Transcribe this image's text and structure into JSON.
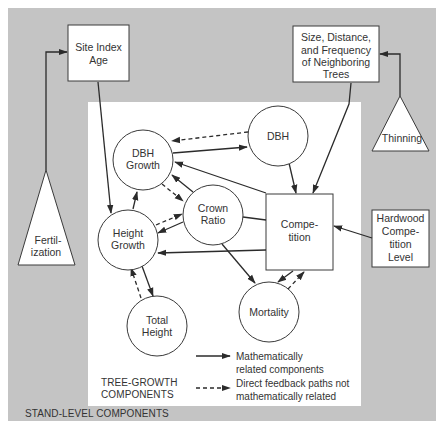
{
  "diagram": {
    "colors": {
      "stand_background": "#c4c4c4",
      "tree_panel": "#ffffff",
      "stroke": "#2b2b2b"
    },
    "regions": {
      "stand_level_label": "STAND-LEVEL COMPONENTS",
      "tree_growth_label_line1": "TREE-GROWTH",
      "tree_growth_label_line2": "COMPONENTS"
    },
    "boxes": {
      "site_index": {
        "line1": "Site Index",
        "line2": "Age"
      },
      "neighbors": {
        "line1": "Size, Distance,",
        "line2": "and Frequency",
        "line3": "of Neighboring",
        "line4": "Trees"
      },
      "hardwood": {
        "line1": "Hardwood",
        "line2": "Compe-",
        "line3": "tition",
        "line4": "Level"
      },
      "competition": {
        "line1": "Compe-",
        "line2": "tition"
      }
    },
    "triangles": {
      "fertilization": {
        "line1": "Fertil-",
        "line2": "ization"
      },
      "thinning": {
        "line1": "Thinning"
      }
    },
    "circles": {
      "dbh_growth": {
        "line1": "DBH",
        "line2": "Growth"
      },
      "dbh": {
        "line1": "DBH"
      },
      "crown_ratio": {
        "line1": "Crown",
        "line2": "Ratio"
      },
      "height_growth": {
        "line1": "Height",
        "line2": "Growth"
      },
      "total_height": {
        "line1": "Total",
        "line2": "Height"
      },
      "mortality": {
        "line1": "Mortality"
      }
    },
    "legend": {
      "solid_line1": "Mathematically",
      "solid_line2": "related components",
      "dashed_line1": "Direct feedback paths not",
      "dashed_line2": "mathematically related"
    },
    "edges": [
      {
        "from": "Fertilization",
        "to": "Site Index Age",
        "type": "solid"
      },
      {
        "from": "Thinning",
        "to": "Size, Distance, and Frequency of Neighboring Trees",
        "type": "solid"
      },
      {
        "from": "Site Index Age",
        "to": "Height Growth",
        "type": "solid"
      },
      {
        "from": "Size, Distance, and Frequency of Neighboring Trees",
        "to": "Competition",
        "type": "solid"
      },
      {
        "from": "Hardwood Competition Level",
        "to": "Competition",
        "type": "solid"
      },
      {
        "from": "DBH Growth",
        "to": "DBH",
        "type": "solid"
      },
      {
        "from": "DBH",
        "to": "DBH Growth",
        "type": "dashed"
      },
      {
        "from": "DBH",
        "to": "Competition",
        "type": "solid"
      },
      {
        "from": "Competition",
        "to": "DBH Growth",
        "type": "solid"
      },
      {
        "from": "Competition",
        "to": "Height Growth",
        "type": "solid"
      },
      {
        "from": "Competition",
        "to": "Crown Ratio",
        "type": "solid"
      },
      {
        "from": "Competition",
        "to": "Mortality",
        "type": "solid"
      },
      {
        "from": "Mortality",
        "to": "Competition",
        "type": "dashed"
      },
      {
        "from": "Crown Ratio",
        "to": "DBH Growth",
        "type": "solid"
      },
      {
        "from": "DBH Growth",
        "to": "Crown Ratio",
        "type": "dashed"
      },
      {
        "from": "Crown Ratio",
        "to": "Height Growth",
        "type": "solid"
      },
      {
        "from": "Height Growth",
        "to": "Crown Ratio",
        "type": "dashed"
      },
      {
        "from": "Crown Ratio",
        "to": "Mortality",
        "type": "solid"
      },
      {
        "from": "Height Growth",
        "to": "DBH Growth",
        "type": "solid"
      },
      {
        "from": "Height Growth",
        "to": "Total Height",
        "type": "solid"
      },
      {
        "from": "Total Height",
        "to": "Height Growth",
        "type": "dashed"
      }
    ]
  }
}
